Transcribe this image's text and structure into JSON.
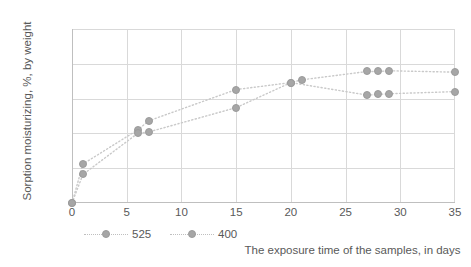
{
  "chart_data": {
    "type": "scatter",
    "title": "",
    "xlabel": "The exposure time of the samples, in days",
    "ylabel": "Sorption moisturizing, %, by weight",
    "xlim": [
      0,
      35
    ],
    "ylim": [
      0,
      25
    ],
    "xticks": [
      0,
      5,
      10,
      15,
      20,
      25,
      30,
      35
    ],
    "yticks": [
      0,
      5,
      10,
      15,
      20,
      25
    ],
    "grid": true,
    "legend_position": "bottom-left",
    "marker_color": "#a6a6a6",
    "line_style": "dotted",
    "gridline_color": "#d9d9d9",
    "series": [
      {
        "name": "525",
        "x": [
          0,
          1,
          6,
          7,
          15,
          20,
          21,
          27,
          28,
          29,
          35
        ],
        "y": [
          0,
          5.6,
          10.5,
          11.8,
          16.3,
          17.3,
          17.7,
          18.9,
          18.9,
          19.0,
          18.8
        ]
      },
      {
        "name": "400",
        "x": [
          0,
          1,
          6,
          7,
          15,
          20,
          27,
          28,
          29,
          35
        ],
        "y": [
          0,
          4.1,
          10.0,
          10.2,
          13.7,
          17.3,
          15.5,
          15.6,
          15.7,
          16.0
        ]
      }
    ]
  },
  "legend": {
    "items": [
      {
        "label": "525"
      },
      {
        "label": "400"
      }
    ]
  }
}
